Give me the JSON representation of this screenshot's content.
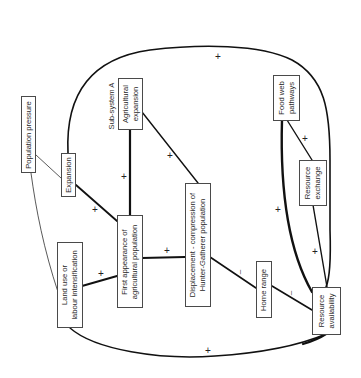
{
  "diagram": {
    "subsystem_label": "Sub-system  A",
    "nodes": {
      "population_pressure": "Population pressure",
      "expansion": "Expansion",
      "agricultural_expansion": [
        "Agricultural",
        "expansion"
      ],
      "first_appearance": [
        "First  appearance  of",
        "agricultural population"
      ],
      "land_use": [
        "Land use or",
        "labour intensification"
      ],
      "displacement": [
        "Displacement - compression of",
        "Hunter-Gatherer  population"
      ],
      "home_range": "Home range",
      "resource_availability": [
        "Resource",
        "availability"
      ],
      "food_web": [
        "Food web",
        "pathways"
      ],
      "resource_exchange": [
        "Resource",
        "exchange"
      ]
    },
    "signs": {
      "top_loop": "+",
      "bottom_loop": "+",
      "agri_to_first": "+",
      "agri_to_displacement": "+",
      "expansion_to_first": "+",
      "land_to_first": "+",
      "first_to_displacement": "+",
      "displacement_to_home": "–",
      "home_to_resource": "–",
      "foodweb_to_exchange": "+",
      "foodweb_to_resource": "+",
      "exchange_to_resource": "+"
    },
    "edges": [
      {
        "from": "Population pressure",
        "to": "Expansion"
      },
      {
        "from": "Population pressure",
        "to": "Land use or labour intensification"
      },
      {
        "from": "Expansion",
        "to": "First appearance of agricultural population",
        "sign": "+"
      },
      {
        "from": "Agricultural expansion",
        "to": "First appearance of agricultural population",
        "sign": "+"
      },
      {
        "from": "Agricultural expansion",
        "to": "Displacement - compression of Hunter-Gatherer population",
        "sign": "+"
      },
      {
        "from": "Land use or labour intensification",
        "to": "First appearance of agricultural population",
        "sign": "+"
      },
      {
        "from": "First appearance of agricultural population",
        "to": "Displacement - compression of Hunter-Gatherer population",
        "sign": "+"
      },
      {
        "from": "Displacement - compression of Hunter-Gatherer population",
        "to": "Home range",
        "sign": "–"
      },
      {
        "from": "Home range",
        "to": "Resource availability",
        "sign": "–"
      },
      {
        "from": "Food web pathways",
        "to": "Resource exchange",
        "sign": "+"
      },
      {
        "from": "Food web pathways",
        "to": "Resource availability",
        "sign": "+"
      },
      {
        "from": "Resource exchange",
        "to": "Resource availability",
        "sign": "+"
      },
      {
        "from": "Expansion",
        "to": "Resource availability",
        "sign": "+",
        "path": "top loop"
      },
      {
        "from": "Land use or labour intensification",
        "to": "Resource availability",
        "sign": "+",
        "path": "bottom loop"
      }
    ]
  }
}
